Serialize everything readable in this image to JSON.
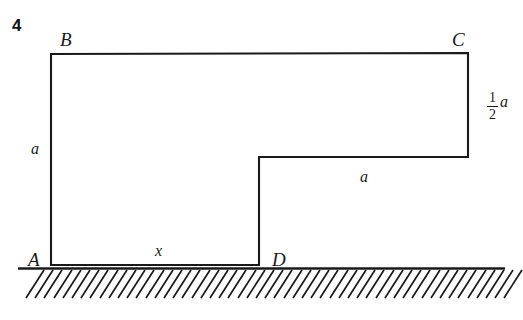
{
  "figure": {
    "problem_number": "4",
    "background_color": "#ffffff",
    "line_color": "#1a1a1a",
    "vertex_labels": [
      {
        "name": "B",
        "text": "B",
        "x": 60,
        "y": 30
      },
      {
        "name": "C",
        "text": "C",
        "x": 452,
        "y": 30
      },
      {
        "name": "A",
        "text": "A",
        "x": 28,
        "y": 250
      },
      {
        "name": "D",
        "text": "D",
        "x": 272,
        "y": 250
      }
    ],
    "dimension_labels": [
      {
        "name": "side-a-left",
        "text": "a",
        "x": 31,
        "y": 141
      },
      {
        "name": "side-x-bottom",
        "text": "x",
        "x": 155,
        "y": 243
      },
      {
        "name": "side-a-step",
        "text": "a",
        "x": 360,
        "y": 169
      }
    ],
    "fraction_label": {
      "name": "half-a-right",
      "numerator": "1",
      "denominator": "2",
      "variable": "a",
      "x": 487,
      "y": 91
    },
    "outline_points": "51,54 468,53 468,157 259,157 259,265 51,265",
    "ground": {
      "baseline_y": 268,
      "x_start": 18,
      "x_end": 505,
      "hatch_count": 53,
      "hatch_spacing": 9.2,
      "hatch_depth": 28
    }
  }
}
